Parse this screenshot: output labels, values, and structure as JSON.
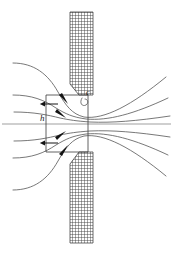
{
  "figure": {
    "background_color": "#ffffff",
    "width": 173,
    "height": 254,
    "line_color": "#555555",
    "hatch_color": "#2b2b2b",
    "arrow_color": "#141414",
    "centerline_color": "#777777"
  },
  "labels": {
    "gap_label": "h",
    "tip_label": "c",
    "gap_label_x": 42,
    "gap_label_y": 120,
    "tip_label_x": 88,
    "tip_label_y": 96
  },
  "plates": {
    "upper": {
      "name": "upper-plate",
      "x_left": 70,
      "x_right": 93,
      "y_top": 12,
      "y_bottom": 95,
      "bevel": "lower-left chamfer"
    },
    "lower": {
      "name": "lower-plate",
      "x_left": 70,
      "x_right": 93,
      "y_top": 152,
      "y_bottom": 243,
      "bevel": "upper-left chamfer"
    }
  },
  "control_volume": {
    "name": "control-volume-box",
    "x": 46,
    "y": 95,
    "width": 42,
    "height": 57
  },
  "centerline": {
    "name": "symmetry-axis",
    "x_start": 2,
    "x_end": 171,
    "y": 124
  },
  "arrows": [
    {
      "name": "inflow-arrow-top",
      "direction": "down",
      "x": 50,
      "y_start": 97,
      "y_end": 113
    },
    {
      "name": "inflow-arrow-bottom",
      "direction": "up",
      "x": 50,
      "y_start": 150,
      "y_end": 134
    },
    {
      "name": "streamline-arrow-upper-outer",
      "direction": "right-down"
    },
    {
      "name": "streamline-arrow-upper-inner",
      "direction": "right-down"
    },
    {
      "name": "streamline-arrow-lower-inner",
      "direction": "right-up"
    },
    {
      "name": "streamline-arrow-lower-outer",
      "direction": "right-up"
    }
  ],
  "streamlines": {
    "count": 6,
    "description": "Symmetric converging streamlines contracting through the slot then diverging downstream"
  }
}
